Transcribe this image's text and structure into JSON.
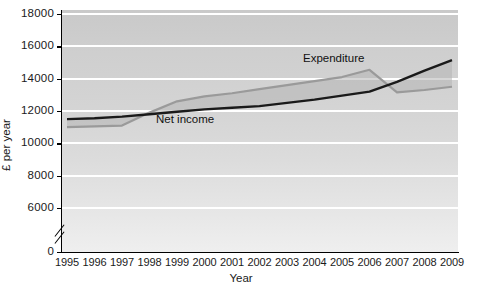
{
  "chart_data": {
    "type": "line",
    "title": "",
    "xlabel": "Year",
    "ylabel": "£ per year",
    "x": [
      1995,
      1996,
      1997,
      1998,
      1999,
      2000,
      2001,
      2002,
      2003,
      2004,
      2005,
      2006,
      2007,
      2008,
      2009
    ],
    "xticklabels": [
      "1995",
      "1996",
      "1997",
      "1998",
      "1999",
      "2000",
      "2001",
      "2002",
      "2003",
      "2004",
      "2005",
      "2006",
      "2007",
      "2008",
      "2009"
    ],
    "yticklabels": [
      "0",
      "6000",
      "8000",
      "10000",
      "12000",
      "14000",
      "16000",
      "18000"
    ],
    "ytickvalues": [
      0,
      6000,
      8000,
      10000,
      12000,
      14000,
      16000,
      18000
    ],
    "ylim": [
      5000,
      18000
    ],
    "axis_break": true,
    "axis_break_between": [
      0,
      6000
    ],
    "grid": "horizontal-white",
    "legend_position": "inline-annotations",
    "series": [
      {
        "name": "Net income",
        "color": "#1a1a1a",
        "style": "solid-black",
        "values": [
          11500,
          11550,
          11650,
          11800,
          11950,
          12100,
          12200,
          12300,
          12500,
          12700,
          12950,
          13200,
          13800,
          14500,
          15150
        ]
      },
      {
        "name": "Expenditure",
        "color": "#9a9a9a",
        "style": "solid-grey",
        "values": [
          11000,
          11050,
          11100,
          11900,
          12600,
          12900,
          13100,
          13350,
          13600,
          13850,
          14100,
          14550,
          13150,
          13300,
          13500
        ]
      }
    ],
    "annotations": [
      {
        "text": "Net income",
        "series": "Net income"
      },
      {
        "text": "Expenditure",
        "series": "Expenditure"
      }
    ],
    "fill_between": {
      "enabled": true,
      "color": "#b4b4b4",
      "opacity": 0.55
    }
  },
  "figure": {
    "background": "#ffffff",
    "plot_background_top": "#c9c9c9",
    "plot_background_bottom": "#efefef",
    "gridline_color": "#ffffff"
  }
}
